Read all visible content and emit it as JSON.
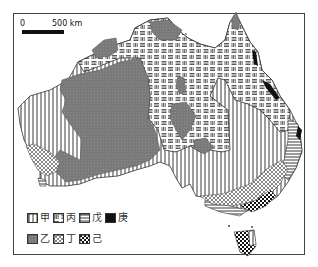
{
  "map": {
    "scale": {
      "zero_label": "0",
      "distance_label": "500 km"
    },
    "legend": {
      "row1": [
        {
          "key": "jia",
          "label": "甲",
          "pattern": "vertical-lines"
        },
        {
          "key": "bing",
          "label": "丙",
          "pattern": "basketweave"
        },
        {
          "key": "wu",
          "label": "戊",
          "pattern": "horizontal-lines"
        },
        {
          "key": "geng",
          "label": "庚",
          "pattern": "solid-black"
        }
      ],
      "row2": [
        {
          "key": "yi",
          "label": "乙",
          "pattern": "dark-gray-stipple"
        },
        {
          "key": "ding",
          "label": "丁",
          "pattern": "light-checker"
        },
        {
          "key": "ji",
          "label": "己",
          "pattern": "bold-checker"
        }
      ]
    },
    "colors": {
      "gray": "#7a7a7a",
      "black": "#111111",
      "line": "#333333"
    }
  }
}
